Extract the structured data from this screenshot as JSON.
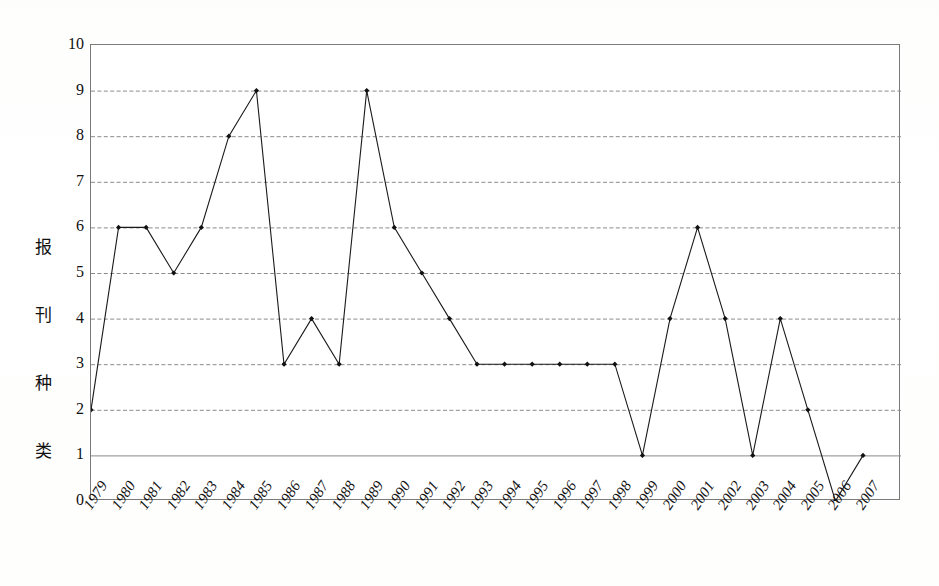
{
  "chart_data": {
    "type": "line",
    "title": "",
    "xlabel": "",
    "ylabel": "报刊种类",
    "ylabel_chars": [
      "报",
      "刊",
      "种",
      "类"
    ],
    "categories": [
      "1979",
      "1980",
      "1981",
      "1982",
      "1983",
      "1984",
      "1985",
      "1986",
      "1987",
      "1988",
      "1989",
      "1990",
      "1991",
      "1992",
      "1993",
      "1994",
      "1995",
      "1996",
      "1997",
      "1998",
      "1999",
      "2000",
      "2001",
      "2002",
      "2003",
      "2004",
      "2005",
      "2006",
      "2007"
    ],
    "values": [
      2,
      6,
      6,
      5,
      6,
      8,
      9,
      3,
      4,
      3,
      9,
      6,
      5,
      4,
      3,
      3,
      3,
      3,
      3,
      3,
      1,
      4,
      6,
      4,
      1,
      4,
      2,
      0,
      1
    ],
    "ylim": [
      0,
      10
    ],
    "y_ticks": [
      "10",
      "9",
      "8",
      "7",
      "6",
      "5",
      "4",
      "3",
      "2",
      "1",
      "0"
    ],
    "y_tick_values": [
      10,
      9,
      8,
      7,
      6,
      5,
      4,
      3,
      2,
      1,
      0
    ],
    "grid": true,
    "grid_style": "dashed-horizontal",
    "legend": "none",
    "marker": "filled-diamond",
    "series": [
      {
        "name": "报刊种类",
        "values": [
          2,
          6,
          6,
          5,
          6,
          8,
          9,
          3,
          4,
          3,
          9,
          6,
          5,
          4,
          3,
          3,
          3,
          3,
          3,
          3,
          1,
          4,
          6,
          4,
          1,
          4,
          2,
          0,
          1
        ]
      }
    ]
  },
  "style": {
    "line_color": "#1a1a1a",
    "marker_color": "#111111",
    "grid_color": "#8a8a8a",
    "frame_color": "#7a7a7a",
    "background": "#ffffff",
    "text_color": "#111111"
  }
}
